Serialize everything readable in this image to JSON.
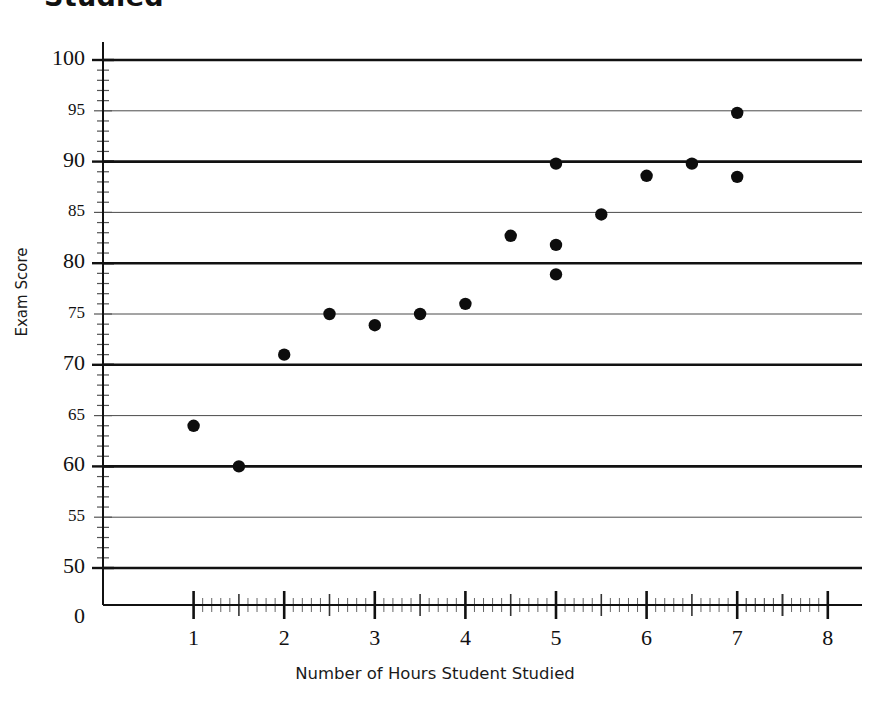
{
  "title": "Studied",
  "chart_data": {
    "type": "scatter",
    "title": "Studied",
    "xlabel": "Number of Hours Student Studied",
    "ylabel": "Exam Score",
    "xlim": [
      0,
      8
    ],
    "ylim": [
      50,
      100
    ],
    "y_axis_has_break_to_zero": true,
    "grid": "horizontal",
    "legend": null,
    "x_ticks": [
      0,
      1,
      2,
      3,
      4,
      5,
      6,
      7,
      8
    ],
    "x_tick_labels": [
      "0",
      "1",
      "2",
      "3",
      "4",
      "5",
      "6",
      "7",
      "8"
    ],
    "x_minor_tick_step": 0.1,
    "x_mid_tick_step": 0.5,
    "y_ticks": [
      50,
      55,
      60,
      65,
      70,
      75,
      80,
      85,
      90,
      95,
      100
    ],
    "y_tick_labels": [
      "50",
      "55",
      "60",
      "65",
      "70",
      "75",
      "80",
      "85",
      "90",
      "95",
      "100"
    ],
    "y_major_ticks": [
      50,
      60,
      70,
      80,
      90,
      100
    ],
    "y_minor_tick_step": 1,
    "series": [
      {
        "name": "Students",
        "marker": "circle",
        "color": "#0d0d0d",
        "points": [
          {
            "x": 1.0,
            "y": 64.0
          },
          {
            "x": 1.5,
            "y": 60.0
          },
          {
            "x": 2.0,
            "y": 71.0
          },
          {
            "x": 2.5,
            "y": 75.0
          },
          {
            "x": 3.0,
            "y": 73.9
          },
          {
            "x": 3.5,
            "y": 75.0
          },
          {
            "x": 4.0,
            "y": 76.0
          },
          {
            "x": 4.5,
            "y": 82.7
          },
          {
            "x": 5.0,
            "y": 89.8
          },
          {
            "x": 5.0,
            "y": 81.8
          },
          {
            "x": 5.0,
            "y": 78.9
          },
          {
            "x": 5.5,
            "y": 84.8
          },
          {
            "x": 6.0,
            "y": 88.6
          },
          {
            "x": 6.5,
            "y": 89.8
          },
          {
            "x": 7.0,
            "y": 94.8
          },
          {
            "x": 7.0,
            "y": 88.5
          }
        ]
      }
    ]
  }
}
